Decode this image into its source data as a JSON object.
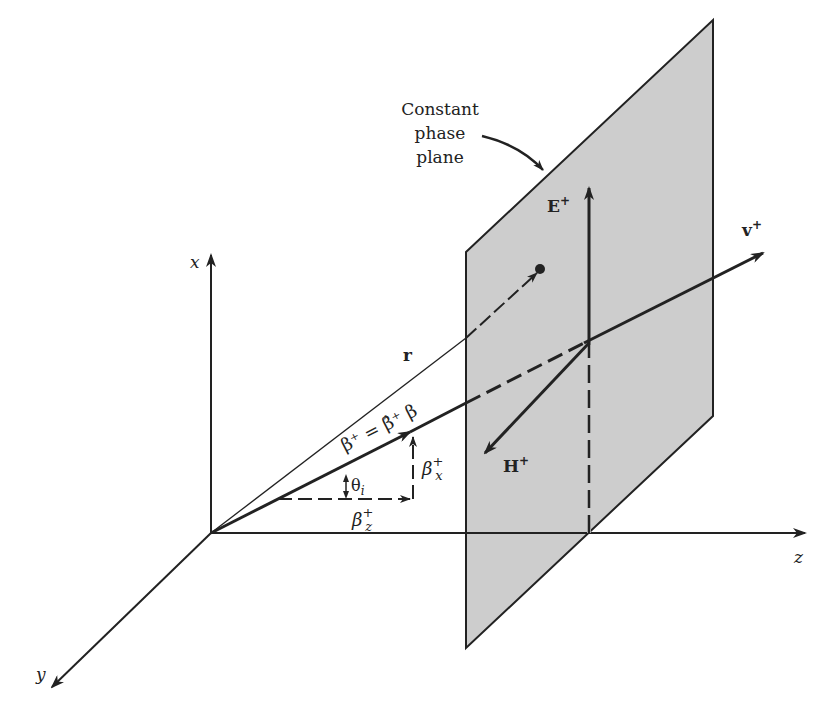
{
  "diagram": {
    "axes": {
      "x": "x",
      "y": "y",
      "z": "z"
    },
    "plane_label": [
      "Constant",
      "phase",
      "plane"
    ],
    "vectors": {
      "E": "E",
      "E_sup": "+",
      "H": "H",
      "H_sup": "+",
      "v": "v",
      "v_sup": "+",
      "r": "r",
      "beta_eq": "β⁺ = β̂⁺ β",
      "beta_x": "β",
      "beta_x_sup": "+",
      "beta_x_sub": "x",
      "beta_z": "β",
      "beta_z_sup": "+",
      "beta_z_sub": "z",
      "theta": "θ",
      "theta_sub": "i"
    },
    "colors": {
      "ink": "#222222",
      "plane_fill": "#cdcdcd",
      "background": "#ffffff"
    }
  }
}
